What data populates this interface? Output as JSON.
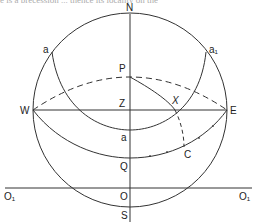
{
  "header": {
    "clipped_text": "e is a precession ... thence its locality on the"
  },
  "diagram": {
    "labels": {
      "N": "N",
      "S": "S",
      "W": "W",
      "E": "E",
      "Z": "Z",
      "P": "P",
      "X": "X",
      "Q": "Q",
      "C": "C",
      "O": "O",
      "a": "a",
      "a_left": "a",
      "a1_right": "a₁",
      "O1_left": "O₁",
      "O1_right": "O₁"
    },
    "colors": {
      "line": "#333333",
      "background": "#ffffff"
    }
  }
}
